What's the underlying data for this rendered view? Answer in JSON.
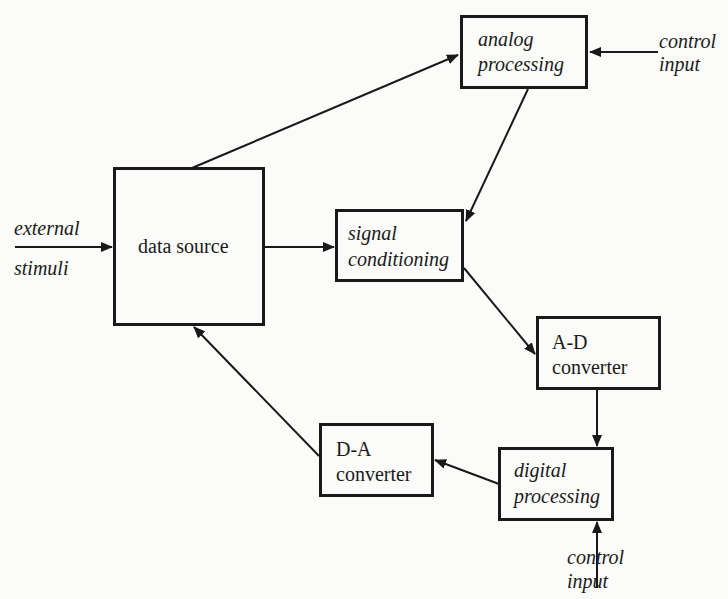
{
  "diagram": {
    "type": "block-diagram",
    "blocks": {
      "analog_processing": {
        "line1": "analog",
        "line2": "processing"
      },
      "data_source": {
        "label": "data source"
      },
      "signal_conditioning": {
        "line1": "signal",
        "line2": "conditioning"
      },
      "ad_converter": {
        "line1": "A-D",
        "line2": "converter"
      },
      "da_converter": {
        "line1": "D-A",
        "line2": "converter"
      },
      "digital_processing": {
        "line1": "digital",
        "line2": "processing"
      }
    },
    "inputs": {
      "external_stimuli": {
        "line1": "external",
        "line2": "stimuli"
      },
      "control_input_analog": {
        "line1": "control",
        "line2": "input"
      },
      "control_input_digital": {
        "line1": "control",
        "line2": "input"
      }
    },
    "connections": [
      {
        "from": "external stimuli",
        "to": "data source"
      },
      {
        "from": "data source",
        "to": "analog processing"
      },
      {
        "from": "control input",
        "to": "analog processing"
      },
      {
        "from": "analog processing",
        "to": "signal conditioning"
      },
      {
        "from": "data source",
        "to": "signal conditioning"
      },
      {
        "from": "signal conditioning",
        "to": "A-D converter"
      },
      {
        "from": "A-D converter",
        "to": "digital processing"
      },
      {
        "from": "control input",
        "to": "digital processing"
      },
      {
        "from": "digital processing",
        "to": "D-A converter"
      },
      {
        "from": "D-A converter",
        "to": "data source"
      }
    ]
  }
}
